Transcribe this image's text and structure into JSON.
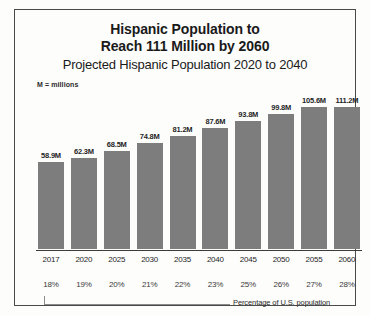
{
  "chart_data": {
    "type": "bar",
    "title": "Hispanic Population to Reach 111 Million by 2060",
    "title_lines": [
      "Hispanic Population to",
      "Reach 111 Million by 2060"
    ],
    "subtitle": "Projected Hispanic Population 2020 to 2040",
    "note": "M = millions",
    "xlabel": "",
    "ylabel": "",
    "ylim": [
      0,
      120
    ],
    "grid": false,
    "legend": false,
    "categories": [
      "2017",
      "2020",
      "2025",
      "2030",
      "2035",
      "2040",
      "2045",
      "2050",
      "2055",
      "2060"
    ],
    "values": [
      58.9,
      62.3,
      68.5,
      74.8,
      81.2,
      87.6,
      93.8,
      99.8,
      105.6,
      111.2
    ],
    "value_labels": [
      "58.9M",
      "62.3M",
      "68.5M",
      "74.8M",
      "81.2M",
      "87.6M",
      "93.8M",
      "99.8M",
      "105.6M",
      "111.2M"
    ],
    "secondary_row_label": "Percentage of U.S. population",
    "secondary_values": [
      "18%",
      "19%",
      "20%",
      "21%",
      "22%",
      "23%",
      "25%",
      "26%",
      "27%",
      "28%"
    ],
    "bar_color": "#7d7d7d",
    "text_color": "#1f1f1f",
    "background": "#fdfdfc"
  },
  "header": {
    "title_line_1": "Hispanic Population to",
    "title_line_2": "Reach 111 Million by 2060",
    "subtitle": "Projected Hispanic Population 2020 to 2040",
    "units_note": "M = millions"
  },
  "footer": {
    "caption": "Percentage of U.S. population"
  }
}
